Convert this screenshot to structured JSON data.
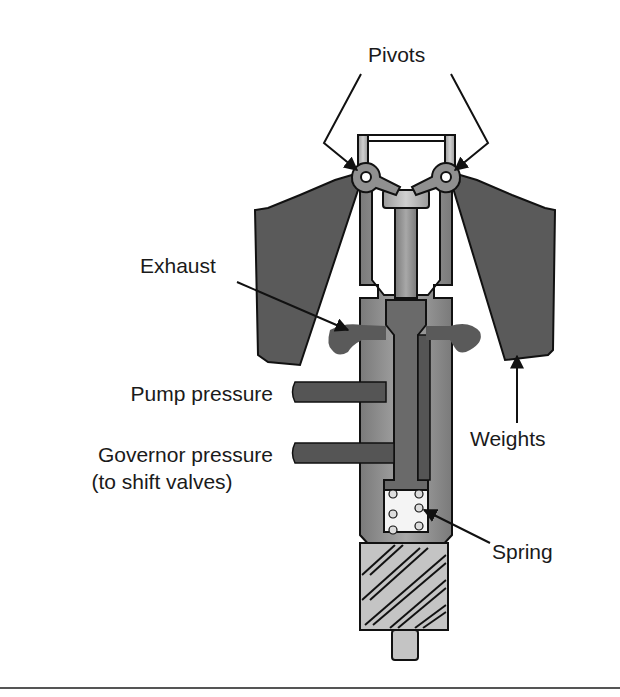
{
  "diagram": {
    "labels": {
      "pivots": "Pivots",
      "exhaust": "Exhaust",
      "pump_pressure": "Pump pressure",
      "governor_pressure_line1": "Governor pressure",
      "governor_pressure_line2": "(to shift valves)",
      "weights": "Weights",
      "spring": "Spring"
    },
    "colors": {
      "dark_fill": "#5a5a5a",
      "mid_fill": "#8a8a8a",
      "light_fill": "#b8b8b8",
      "outline": "#111111",
      "background": "#ffffff"
    }
  }
}
